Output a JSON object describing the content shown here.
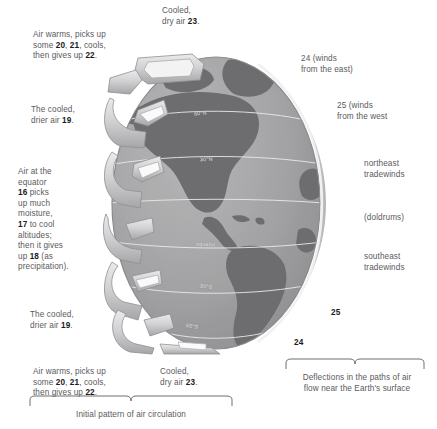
{
  "figure": {
    "globe": {
      "name": "earth-globe",
      "hemisphere": "Americas / western hemisphere",
      "latitude_labels": [
        "60°N",
        "30°N",
        "equator",
        "30°S",
        "60°S"
      ],
      "colors": {
        "ocean": "#a5a5a7",
        "land": "#6d6d70",
        "limb_highlight": "#c9c9cb",
        "arrow_ribbon": "#d6d6d8",
        "arrow_shadow": "#8f8f92"
      }
    }
  },
  "annotations": {
    "top_left": "Air warms, picks up\nsome 20, 21, cools,\nthen gives up 22.",
    "top_left_bold": [
      "20",
      "21",
      "22"
    ],
    "top_center": "Cooled,\ndry air 23.",
    "top_center_bold": [
      "23"
    ],
    "upper_left": "The cooled,\ndrier air 19.",
    "upper_left_bold": [
      "19"
    ],
    "mid_left": "Air at the\nequator\n16 picks\nup much\nmoisture,\n17 to cool\naltitudes;\nthen it gives\nup 18 (as\nprecipitation).",
    "mid_left_bold": [
      "16",
      "17",
      "18"
    ],
    "lower_left": "The cooled,\ndrier air 19.",
    "lower_left_bold": [
      "19"
    ],
    "bottom_left": "Air warms, picks up\nsome 20, 21, cools,\nthen gives up 22.",
    "bottom_left_bold": [
      "20",
      "21",
      "22"
    ],
    "bottom_center": "Cooled,\ndry air 23.",
    "bottom_center_bold": [
      "23"
    ],
    "right_24": "24 (winds\nfrom the east)",
    "right_25": "25 (winds\nfrom the west",
    "northeast_tradewinds": "northeast\ntradewinds",
    "doldrums": "(doldrums)",
    "southeast_tradewinds": "southeast\ntradewinds",
    "marker_25": "25",
    "marker_24": "24"
  },
  "captions": {
    "left": "Initial pattern of air circulation",
    "right": "Deflections in the paths of air\nflow near the Earth's surface"
  }
}
